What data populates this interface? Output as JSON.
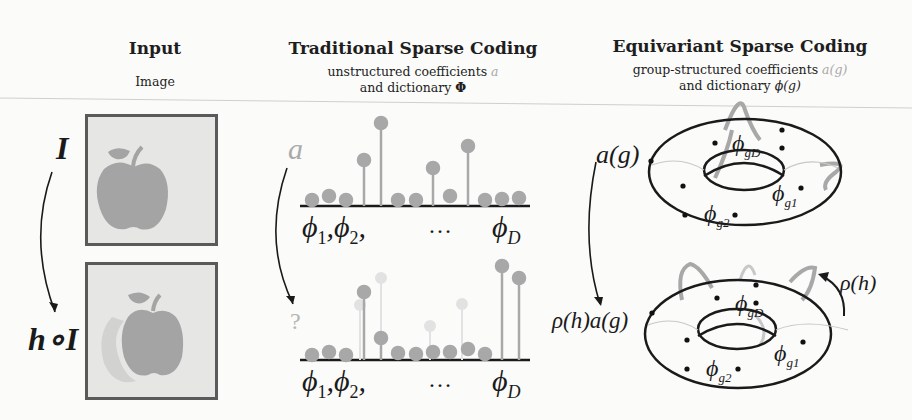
{
  "columns": {
    "input": {
      "title": "Input",
      "subtitle": "Image"
    },
    "traditional": {
      "title": "Traditional Sparse Coding",
      "subtitle_line1": "unstructured coefficients",
      "subtitle_line1_symbol": "a",
      "subtitle_line2": "and dictionary",
      "subtitle_line2_symbol": "Φ"
    },
    "equivariant": {
      "title": "Equivariant Sparse Coding",
      "subtitle_line1": "group-structured coefficients",
      "subtitle_line1_symbol": "a(g)",
      "subtitle_line2": "and dictionary",
      "subtitle_line2_symbol": "ϕ(g)"
    }
  },
  "input_panel": {
    "top_label": "I",
    "bottom_label": "h∘I"
  },
  "traditional_panel": {
    "top_coeff_label": "a",
    "bottom_coeff_label": "?",
    "axis_labels": {
      "phi1": "ϕ",
      "phi1_sub": "1",
      "phi2": "ϕ",
      "phi2_sub": "2",
      "ellipsis": "…",
      "phiD": "ϕ",
      "phiD_sub": "D"
    },
    "top_stems": [
      0.05,
      0.1,
      0.05,
      0.6,
      1.0,
      0.03,
      0.05,
      0.45,
      0.12,
      0.7,
      0.03,
      0.05,
      0.06
    ],
    "bottom_stems": [
      0.05,
      0.1,
      0.05,
      0.75,
      0.25,
      0.06,
      0.05,
      0.08,
      0.08,
      0.12,
      0.04,
      1.0,
      0.9
    ]
  },
  "equivariant_panel": {
    "top_coeff_label": "a(g)",
    "bottom_coeff_label": "ρ(h)a(g)",
    "action_label": "ρ(h)",
    "dict_labels": {
      "gD": "ϕ",
      "gD_sub": "gD",
      "g1": "ϕ",
      "g1_sub": "g1",
      "g2": "ϕ",
      "g2_sub": "g2"
    }
  },
  "colors": {
    "stem": "#a8a8a8",
    "stem_faint": "#dcdcdc",
    "apple": "#a4a4a4",
    "image_bg": "#e6e6e4",
    "axis": "#1a1a1a"
  }
}
